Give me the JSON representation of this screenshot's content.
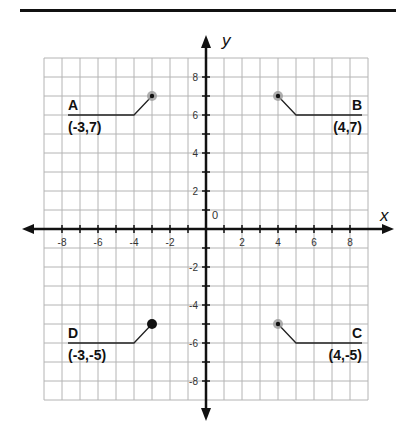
{
  "chart_data": {
    "type": "scatter",
    "title": "",
    "xlabel": "x",
    "ylabel": "y",
    "xlim": [
      -9,
      9
    ],
    "ylim": [
      -9,
      9
    ],
    "grid": true,
    "origin_label": "0",
    "x_ticks": [
      -8,
      -6,
      -4,
      -2,
      2,
      4,
      6,
      8
    ],
    "y_ticks": [
      8,
      6,
      4,
      2,
      -2,
      -4,
      -6,
      -8
    ],
    "points": [
      {
        "name": "A",
        "x": -3,
        "y": 7,
        "label": "(-3,7)",
        "style": "gray-halo"
      },
      {
        "name": "B",
        "x": 4,
        "y": 7,
        "label": "(4,7)",
        "style": "gray-halo"
      },
      {
        "name": "C",
        "x": 4,
        "y": -5,
        "label": "(4,-5)",
        "style": "gray-halo"
      },
      {
        "name": "D",
        "x": -3,
        "y": -5,
        "label": "(-3,-5)",
        "style": "solid-black"
      }
    ]
  },
  "colors": {
    "axis": "#111111",
    "grid": "#b4b4b4",
    "point": "#111111",
    "halo": "#9a9a9a"
  }
}
